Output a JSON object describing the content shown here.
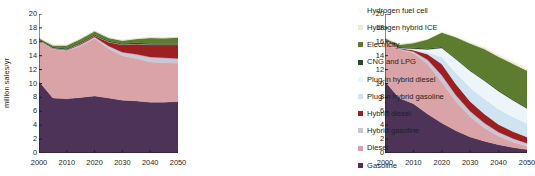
{
  "chart_data": [
    {
      "type": "area",
      "panel": "left",
      "title": "",
      "xlabel": "",
      "ylabel": "million sales/yr",
      "xlim": [
        2000,
        2050
      ],
      "ylim": [
        0,
        20
      ],
      "xticks": [
        2000,
        2010,
        2020,
        2030,
        2040,
        2050
      ],
      "yticks": [
        0,
        2,
        4,
        6,
        8,
        10,
        12,
        14,
        16,
        18,
        20
      ],
      "grid": false,
      "x": [
        2000,
        2005,
        2010,
        2015,
        2020,
        2025,
        2030,
        2035,
        2040,
        2045,
        2050
      ],
      "series": [
        {
          "name": "Gasoline",
          "color": "#4c3357",
          "values": [
            10.3,
            7.9,
            7.8,
            8.0,
            8.2,
            7.9,
            7.6,
            7.5,
            7.3,
            7.3,
            7.4
          ]
        },
        {
          "name": "Diesel",
          "color": "#d9a3a8",
          "values": [
            6.0,
            7.0,
            6.9,
            7.4,
            8.3,
            7.1,
            6.4,
            6.1,
            5.8,
            5.7,
            5.5
          ]
        },
        {
          "name": "Hybrid gasoline",
          "color": "#c9c6d6",
          "values": [
            0.0,
            0.1,
            0.1,
            0.2,
            0.2,
            0.4,
            0.5,
            0.6,
            0.7,
            0.7,
            0.7
          ]
        },
        {
          "name": "Hybrid diesel",
          "color": "#9c2021",
          "values": [
            0.0,
            0.1,
            0.1,
            0.2,
            0.2,
            0.6,
            1.1,
            1.5,
            1.8,
            1.9,
            2.0
          ]
        },
        {
          "name": "Plug-in hybrid gasoline",
          "color": "#cfe4f1",
          "values": [
            0.0,
            0.0,
            0.0,
            0.0,
            0.0,
            0.0,
            0.0,
            0.0,
            0.0,
            0.0,
            0.0
          ]
        },
        {
          "name": "Plug-in hybrid diesel",
          "color": "#eef5fa",
          "values": [
            0.0,
            0.0,
            0.0,
            0.0,
            0.0,
            0.0,
            0.0,
            0.0,
            0.0,
            0.0,
            0.0
          ]
        },
        {
          "name": "CNG and LPG",
          "color": "#2f4a23",
          "values": [
            0.15,
            0.15,
            0.15,
            0.15,
            0.15,
            0.15,
            0.15,
            0.15,
            0.15,
            0.15,
            0.15
          ]
        },
        {
          "name": "Electricity",
          "color": "#5d7c2f",
          "values": [
            0.1,
            0.25,
            0.45,
            0.5,
            0.5,
            0.45,
            0.45,
            0.6,
            0.85,
            0.8,
            0.9
          ]
        },
        {
          "name": "Hydrogen hybrid ICE",
          "color": "#efe9cf",
          "values": [
            0.0,
            0.0,
            0.0,
            0.0,
            0.0,
            0.0,
            0.0,
            0.0,
            0.0,
            0.0,
            0.0
          ]
        },
        {
          "name": "Hydrogen fuel cell",
          "color": "#fbfaf5",
          "values": [
            0.0,
            0.0,
            0.0,
            0.0,
            0.0,
            0.0,
            0.0,
            0.0,
            0.0,
            0.0,
            0.0
          ]
        }
      ]
    },
    {
      "type": "area",
      "panel": "right",
      "title": "",
      "xlabel": "",
      "ylabel": "",
      "xlim": [
        2000,
        2050
      ],
      "ylim": [
        0,
        20
      ],
      "xticks": [
        2000,
        2010,
        2020,
        2030,
        2040,
        2050
      ],
      "yticks": [
        0,
        2,
        4,
        6,
        8,
        10,
        12,
        14,
        16,
        18,
        20
      ],
      "grid": false,
      "x": [
        2000,
        2005,
        2010,
        2015,
        2020,
        2025,
        2030,
        2035,
        2040,
        2045,
        2050
      ],
      "series": [
        {
          "name": "Gasoline",
          "color": "#4c3357",
          "values": [
            10.3,
            7.9,
            7.1,
            5.6,
            4.3,
            3.2,
            2.3,
            1.7,
            1.2,
            0.8,
            0.5
          ]
        },
        {
          "name": "Diesel",
          "color": "#d9a3a8",
          "values": [
            6.0,
            7.0,
            7.3,
            7.2,
            5.9,
            4.2,
            2.9,
            1.9,
            1.2,
            0.8,
            0.5
          ]
        },
        {
          "name": "Hybrid gasoline",
          "color": "#c9c6d6",
          "values": [
            0.0,
            0.1,
            0.2,
            0.6,
            1.0,
            0.9,
            0.8,
            0.7,
            0.6,
            0.5,
            0.4
          ]
        },
        {
          "name": "Hybrid diesel",
          "color": "#9c2021",
          "values": [
            0.0,
            0.1,
            0.2,
            0.8,
            1.6,
            1.6,
            1.4,
            1.3,
            1.1,
            1.0,
            0.9
          ]
        },
        {
          "name": "Plug-in hybrid gasoline",
          "color": "#cfe4f1",
          "values": [
            0.0,
            0.0,
            0.1,
            0.3,
            1.0,
            1.6,
            2.0,
            2.2,
            2.2,
            2.1,
            1.9
          ]
        },
        {
          "name": "Plug-in hybrid diesel",
          "color": "#eef5fa",
          "values": [
            0.0,
            0.0,
            0.1,
            0.4,
            1.3,
            2.0,
            2.4,
            2.6,
            2.6,
            2.4,
            2.2
          ]
        },
        {
          "name": "CNG and LPG",
          "color": "#2f4a23",
          "values": [
            0.15,
            0.15,
            0.15,
            0.15,
            0.15,
            0.15,
            0.15,
            0.15,
            0.15,
            0.15,
            0.15
          ]
        },
        {
          "name": "Electricity",
          "color": "#5d7c2f",
          "values": [
            0.1,
            0.35,
            0.7,
            1.3,
            2.1,
            3.0,
            3.8,
            4.4,
            4.8,
            5.1,
            5.3
          ]
        },
        {
          "name": "Hydrogen hybrid ICE",
          "color": "#efe9cf",
          "values": [
            0.0,
            0.0,
            0.0,
            0.05,
            0.1,
            0.15,
            0.2,
            0.25,
            0.3,
            0.3,
            0.3
          ]
        },
        {
          "name": "Hydrogen fuel cell",
          "color": "#fbfaf5",
          "values": [
            0.0,
            0.0,
            0.0,
            0.05,
            0.1,
            0.15,
            0.2,
            0.25,
            0.3,
            0.3,
            0.3
          ]
        }
      ]
    }
  ],
  "axes": {
    "ylabel": "million sales/yr",
    "yticks": [
      "20",
      "18",
      "16",
      "14",
      "12",
      "10",
      "8",
      "6",
      "4",
      "2",
      "0"
    ],
    "xticks": [
      "2000",
      "2010",
      "2020",
      "2030",
      "2040",
      "2050"
    ]
  },
  "legend": {
    "position": "right",
    "items": [
      {
        "label": "Hydrogen fuel cell",
        "color": "#fbfaf5"
      },
      {
        "label": "Hydrogen hybrid ICE",
        "color": "#efe9cf"
      },
      {
        "label": "Electricity",
        "color": "#5d7c2f"
      },
      {
        "label": "CNG and LPG",
        "color": "#2f4a23"
      },
      {
        "label": "Plug-in hybrid diesel",
        "color": "#eef5fa"
      },
      {
        "label": "Plug-in hybrid gasoline",
        "color": "#cfe4f1"
      },
      {
        "label": "Hybrid diesel",
        "color": "#9c2021"
      },
      {
        "label": "Hybrid gasoline",
        "color": "#c9c6d6"
      },
      {
        "label": "Diesel",
        "color": "#d9a3a8"
      },
      {
        "label": "Gasoline",
        "color": "#4c3357"
      }
    ]
  }
}
